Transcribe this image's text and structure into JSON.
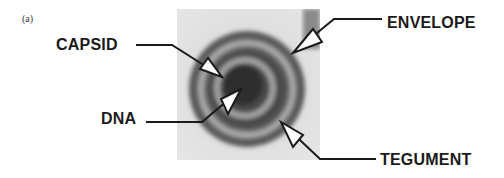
{
  "figure": {
    "panel_label": "(a)",
    "labels": {
      "capsid": "CAPSID",
      "envelope": "ENVELOPE",
      "dna": "DNA",
      "tegument": "TEGUMENT"
    },
    "colors": {
      "background": "#ffffff",
      "text": "#1a1a1a",
      "micrograph_bg": "#dcdcdc",
      "outer_ring": "#555555",
      "inner_core": "#2e2e2e"
    }
  }
}
